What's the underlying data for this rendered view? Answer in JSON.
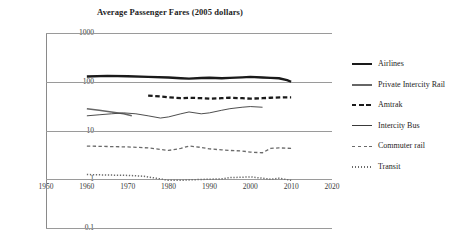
{
  "chart_data": {
    "type": "line",
    "title": "Average Passenger Fares (2005 dollars)",
    "xlabel": "",
    "ylabel": "",
    "yscale": "log",
    "ylim": [
      0.1,
      1000
    ],
    "xlim": [
      1950,
      2020
    ],
    "grid": true,
    "legend_position": "right",
    "ytick_labels": [
      "1000",
      "100",
      "10",
      "1",
      "0.1"
    ],
    "ytick_values": [
      1000,
      100,
      10,
      1,
      0.1
    ],
    "xtick_labels": [
      "1950",
      "1960",
      "1970",
      "1980",
      "1990",
      "2000",
      "2010",
      "2020"
    ],
    "xtick_values": [
      1950,
      1960,
      1970,
      1980,
      1990,
      2000,
      2010,
      2020
    ],
    "series": [
      {
        "name": "Airlines",
        "style": "solid-thick",
        "color": "#1a1a1a",
        "x": [
          1960,
          1965,
          1970,
          1975,
          1980,
          1983,
          1985,
          1988,
          1990,
          1993,
          1995,
          1998,
          2000,
          2003,
          2005,
          2007,
          2009,
          2010
        ],
        "y": [
          128,
          132,
          130,
          126,
          122,
          118,
          116,
          119,
          121,
          118,
          120,
          123,
          126,
          122,
          120,
          118,
          108,
          100
        ]
      },
      {
        "name": "Private Intercity Rail",
        "style": "solid-medium",
        "color": "#666666",
        "x": [
          1960,
          1963,
          1966,
          1969,
          1971
        ],
        "y": [
          28,
          26,
          24,
          22,
          20
        ]
      },
      {
        "name": "Amtrak",
        "style": "dashed-thick",
        "color": "#1a1a1a",
        "x": [
          1975,
          1978,
          1980,
          1983,
          1985,
          1988,
          1990,
          1993,
          1995,
          1998,
          2000,
          2003,
          2005,
          2008,
          2010
        ],
        "y": [
          52,
          50,
          48,
          46,
          47,
          46,
          45,
          46,
          47,
          46,
          45,
          46,
          47,
          48,
          48
        ]
      },
      {
        "name": "Intercity Bus",
        "style": "solid-thin",
        "color": "#3a3a3a",
        "x": [
          1960,
          1963,
          1966,
          1969,
          1972,
          1975,
          1978,
          1980,
          1983,
          1985,
          1988,
          1990,
          1993,
          1995,
          1998,
          2000,
          2003
        ],
        "y": [
          20,
          21,
          22,
          23,
          22,
          20,
          18,
          19,
          22,
          24,
          22,
          23,
          26,
          28,
          30,
          31,
          30
        ]
      },
      {
        "name": "Commuter rail",
        "style": "dashed-thin",
        "color": "#6a6a6a",
        "x": [
          1960,
          1965,
          1970,
          1975,
          1978,
          1980,
          1983,
          1985,
          1988,
          1990,
          1993,
          1995,
          1998,
          2000,
          2003,
          2005,
          2007,
          2010
        ],
        "y": [
          4.8,
          4.7,
          4.6,
          4.4,
          4.1,
          3.9,
          4.3,
          4.8,
          4.5,
          4.2,
          4.0,
          3.9,
          3.8,
          3.6,
          3.5,
          4.3,
          4.4,
          4.3
        ]
      },
      {
        "name": "Transit",
        "style": "dotted",
        "color": "#6a6a6a",
        "x": [
          1960,
          1965,
          1970,
          1974,
          1977,
          1980,
          1983,
          1985,
          1988,
          1990,
          1993,
          1995,
          1998,
          2000,
          2003,
          2005,
          2007,
          2010
        ],
        "y": [
          1.25,
          1.22,
          1.2,
          1.15,
          1.05,
          0.95,
          0.95,
          0.97,
          0.99,
          1.0,
          1.02,
          1.08,
          1.1,
          1.12,
          1.05,
          1.0,
          1.05,
          0.95
        ]
      }
    ]
  }
}
